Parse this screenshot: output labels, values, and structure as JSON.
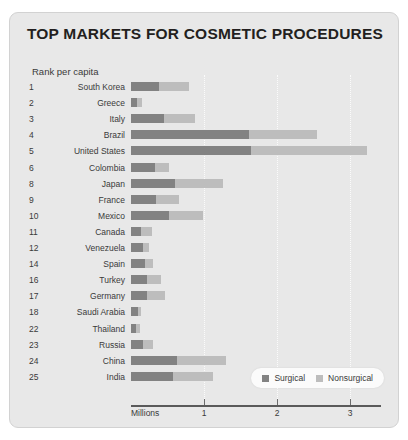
{
  "title": "TOP MARKETS FOR COSMETIC PROCEDURES",
  "subtitle": "Rank per capita",
  "axis_title": "Millions",
  "legend": {
    "surgical": "Surgical",
    "nonsurgical": "Nonsurgical"
  },
  "colors": {
    "surgical": "#828282",
    "nonsurgical": "#bdbdbd",
    "card_background": "#e8e8e8",
    "title_text": "#231f20",
    "axis": "#5a5a5a"
  },
  "chart_data": {
    "type": "bar",
    "orientation": "horizontal",
    "stacked": true,
    "title": "TOP MARKETS FOR COSMETIC PROCEDURES",
    "xlabel": "Millions",
    "ylabel": "Rank per capita",
    "xlim": [
      0,
      3.4
    ],
    "xticks": [
      1,
      2,
      3
    ],
    "xticklabels": [
      "1",
      "2",
      "3"
    ],
    "grid": true,
    "legend_position": "bottom-right",
    "categories": [
      "South Korea",
      "Greece",
      "Italy",
      "Brazil",
      "United States",
      "Colombia",
      "Japan",
      "France",
      "Mexico",
      "Canada",
      "Venezuela",
      "Spain",
      "Turkey",
      "Germany",
      "Saudi Arabia",
      "Thailand",
      "Russia",
      "China",
      "India"
    ],
    "ranks": [
      "1",
      "2",
      "3",
      "4",
      "5",
      "6",
      "8",
      "9",
      "10",
      "11",
      "12",
      "14",
      "16",
      "17",
      "18",
      "22",
      "23",
      "24",
      "25"
    ],
    "series": [
      {
        "name": "Surgical",
        "color": "#828282",
        "values": [
          0.39,
          0.08,
          0.45,
          1.62,
          1.65,
          0.33,
          0.6,
          0.34,
          0.52,
          0.14,
          0.16,
          0.19,
          0.22,
          0.22,
          0.09,
          0.07,
          0.16,
          0.63,
          0.58
        ]
      },
      {
        "name": "Nonsurgical",
        "color": "#bdbdbd",
        "values": [
          0.41,
          0.07,
          0.42,
          0.93,
          1.58,
          0.19,
          0.66,
          0.32,
          0.47,
          0.15,
          0.08,
          0.11,
          0.19,
          0.25,
          0.05,
          0.06,
          0.14,
          0.67,
          0.55
        ]
      }
    ],
    "rows": [
      {
        "rank": "1",
        "country": "South Korea",
        "surgical": 0.39,
        "nonsurgical": 0.41,
        "total": 0.8
      },
      {
        "rank": "2",
        "country": "Greece",
        "surgical": 0.08,
        "nonsurgical": 0.07,
        "total": 0.15
      },
      {
        "rank": "3",
        "country": "Italy",
        "surgical": 0.45,
        "nonsurgical": 0.42,
        "total": 0.87
      },
      {
        "rank": "4",
        "country": "Brazil",
        "surgical": 1.62,
        "nonsurgical": 0.93,
        "total": 2.55
      },
      {
        "rank": "5",
        "country": "United States",
        "surgical": 1.65,
        "nonsurgical": 1.58,
        "total": 3.23
      },
      {
        "rank": "6",
        "country": "Colombia",
        "surgical": 0.33,
        "nonsurgical": 0.19,
        "total": 0.52
      },
      {
        "rank": "8",
        "country": "Japan",
        "surgical": 0.6,
        "nonsurgical": 0.66,
        "total": 1.26
      },
      {
        "rank": "9",
        "country": "France",
        "surgical": 0.34,
        "nonsurgical": 0.32,
        "total": 0.66
      },
      {
        "rank": "10",
        "country": "Mexico",
        "surgical": 0.52,
        "nonsurgical": 0.47,
        "total": 0.99
      },
      {
        "rank": "11",
        "country": "Canada",
        "surgical": 0.14,
        "nonsurgical": 0.15,
        "total": 0.29
      },
      {
        "rank": "12",
        "country": "Venezuela",
        "surgical": 0.16,
        "nonsurgical": 0.08,
        "total": 0.24
      },
      {
        "rank": "14",
        "country": "Spain",
        "surgical": 0.19,
        "nonsurgical": 0.11,
        "total": 0.3
      },
      {
        "rank": "16",
        "country": "Turkey",
        "surgical": 0.22,
        "nonsurgical": 0.19,
        "total": 0.41
      },
      {
        "rank": "17",
        "country": "Germany",
        "surgical": 0.22,
        "nonsurgical": 0.25,
        "total": 0.47
      },
      {
        "rank": "18",
        "country": "Saudi Arabia",
        "surgical": 0.09,
        "nonsurgical": 0.05,
        "total": 0.14
      },
      {
        "rank": "22",
        "country": "Thailand",
        "surgical": 0.07,
        "nonsurgical": 0.06,
        "total": 0.13
      },
      {
        "rank": "23",
        "country": "Russia",
        "surgical": 0.16,
        "nonsurgical": 0.14,
        "total": 0.3
      },
      {
        "rank": "24",
        "country": "China",
        "surgical": 0.63,
        "nonsurgical": 0.67,
        "total": 1.3
      },
      {
        "rank": "25",
        "country": "India",
        "surgical": 0.58,
        "nonsurgical": 0.55,
        "total": 1.13
      }
    ]
  }
}
